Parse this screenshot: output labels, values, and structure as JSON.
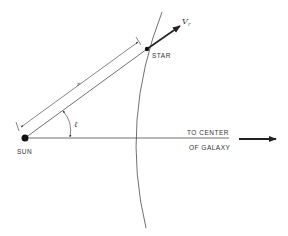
{
  "diagram": {
    "type": "galactic-geometry",
    "labels": {
      "sun": "SUN",
      "star": "STAR",
      "velocity": "V",
      "velocity_sub": "r",
      "distance": "r",
      "angle": "ℓ",
      "center_line1": "TO CENTER",
      "center_line2": "OF GALAXY"
    },
    "colors": {
      "ink": "#222222",
      "text": "#333333",
      "background": "#ffffff"
    }
  }
}
